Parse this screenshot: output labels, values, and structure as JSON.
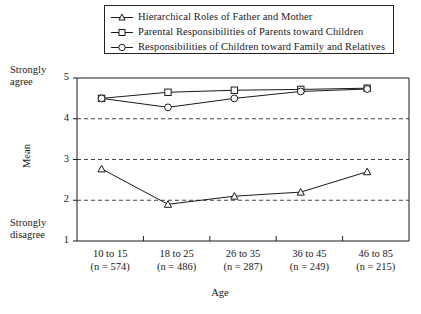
{
  "chart_data": {
    "type": "line",
    "title": "",
    "xlabel": "Age",
    "ylabel": "Mean",
    "ylim": [
      1,
      5
    ],
    "yticks": [
      1,
      2,
      3,
      4,
      5
    ],
    "ytick_labels": [
      "1",
      "2",
      "3",
      "4",
      "5"
    ],
    "y_axis_top_annotation": "Strongly agree",
    "y_axis_bottom_annotation": "Strongly disagree",
    "grid": "horizontal dashed gridlines at y = 2, 3, 4",
    "legend_position": "top-center, boxed, above plot area",
    "categories": [
      "10 to 15",
      "18 to 25",
      "26 to 35",
      "36 to 45",
      "46 to 85"
    ],
    "category_sublabels": [
      "(n = 574)",
      "(n = 486)",
      "(n = 287)",
      "(n = 249)",
      "(n = 215)"
    ],
    "sample_sizes": [
      574,
      486,
      287,
      249,
      215
    ],
    "series": [
      {
        "name": "Hierarchical Roles of Father and Mother",
        "marker": "triangle",
        "values": [
          2.77,
          1.9,
          2.1,
          2.2,
          2.7
        ]
      },
      {
        "name": "Parental Responsibilities of Parents toward Children",
        "marker": "square",
        "values": [
          4.5,
          4.65,
          4.7,
          4.72,
          4.75
        ]
      },
      {
        "name": "Responsibilities of Children toward Family and Relatives",
        "marker": "circle",
        "values": [
          4.5,
          4.28,
          4.5,
          4.67,
          4.73
        ]
      }
    ]
  },
  "legend": {
    "items": [
      {
        "label": "Hierarchical Roles of Father and Mother",
        "marker": "triangle-marker"
      },
      {
        "label": "Parental Responsibilities of Parents toward Children",
        "marker": "square-marker"
      },
      {
        "label": "Responsibilities of Children toward Family and Relatives",
        "marker": "circle-marker"
      }
    ]
  },
  "axes": {
    "y_label": "Mean",
    "y_top_text": "Strongly agree",
    "y_bottom_text": "Strongly disagree",
    "x_label": "Age",
    "y_ticks": [
      "5",
      "4",
      "3",
      "2",
      "1"
    ]
  },
  "colors": {
    "line": "#1a1a1a",
    "grid": "#444444",
    "axis": "#1a1a1a",
    "background": "#ffffff",
    "marker_fill": "#ffffff"
  }
}
